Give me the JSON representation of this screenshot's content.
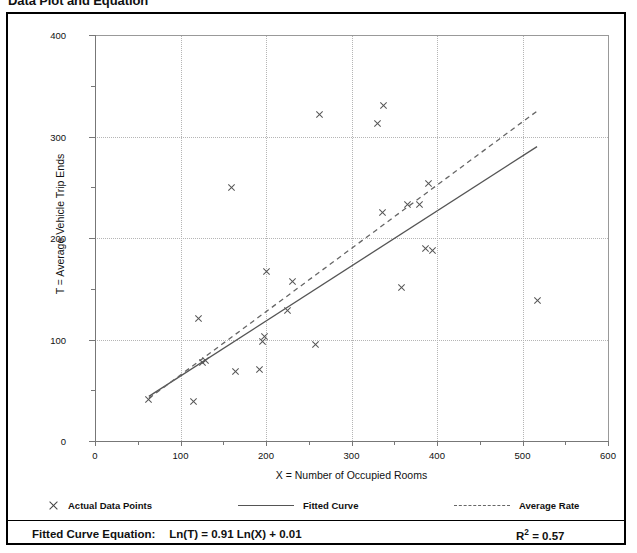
{
  "figure": {
    "title": "Data Plot and Equation"
  },
  "legend": {
    "items": [
      {
        "label": "Actual Data Points",
        "marker": "x-marker-icon"
      },
      {
        "label": "Fitted Curve",
        "marker": "solid-line-icon"
      },
      {
        "label": "Average Rate",
        "marker": "dashed-line-icon"
      }
    ]
  },
  "equation": {
    "label": "Fitted Curve Equation:",
    "expression": "Ln(T) = 0.91 Ln(X) + 0.01",
    "r2_symbol": "R",
    "r2_exponent": "2",
    "r2_value": "= 0.57"
  },
  "chart_data": {
    "type": "scatter",
    "title": "Data Plot and Equation",
    "xlabel": "X = Number of Occupied Rooms",
    "ylabel": "T = Average Vehicle Trip Ends",
    "xlim": [
      0,
      600
    ],
    "ylim": [
      0,
      400
    ],
    "xticks": [
      0,
      100,
      200,
      300,
      400,
      500,
      600
    ],
    "yticks": [
      0,
      100,
      200,
      300,
      400
    ],
    "x_minor_tick_interval": 50,
    "y_minor_tick_interval": 50,
    "grid": true,
    "legend_position": "below-axes",
    "series": [
      {
        "name": "Actual Data Points",
        "type": "scatter",
        "marker": "x",
        "color": "#555555",
        "points": [
          [
            63,
            41
          ],
          [
            115,
            39
          ],
          [
            121,
            121
          ],
          [
            126,
            77
          ],
          [
            129,
            79
          ],
          [
            160,
            250
          ],
          [
            164,
            68
          ],
          [
            192,
            70
          ],
          [
            196,
            98
          ],
          [
            198,
            103
          ],
          [
            201,
            167
          ],
          [
            225,
            129
          ],
          [
            231,
            157
          ],
          [
            258,
            95
          ],
          [
            263,
            322
          ],
          [
            330,
            313
          ],
          [
            337,
            331
          ],
          [
            336,
            225
          ],
          [
            358,
            151
          ],
          [
            366,
            233
          ],
          [
            380,
            233
          ],
          [
            386,
            190
          ],
          [
            395,
            188
          ],
          [
            390,
            254
          ],
          [
            517,
            138
          ]
        ]
      },
      {
        "name": "Fitted Curve",
        "type": "line",
        "style": "solid",
        "color": "#555555",
        "equation": "Ln(T) = 0.91 Ln(X) + 0.01",
        "endpoints": [
          [
            63,
            44
          ],
          [
            517,
            290
          ]
        ]
      },
      {
        "name": "Average Rate",
        "type": "line",
        "style": "dashed",
        "color": "#666666",
        "endpoints": [
          [
            63,
            42
          ],
          [
            517,
            325
          ]
        ]
      }
    ],
    "annotations": [
      {
        "text": "R2 = 0.57",
        "role": "goodness-of-fit"
      },
      {
        "text": "Fitted Curve Equation:  Ln(T) = 0.91 Ln(X) + 0.01",
        "role": "model-equation"
      }
    ]
  }
}
